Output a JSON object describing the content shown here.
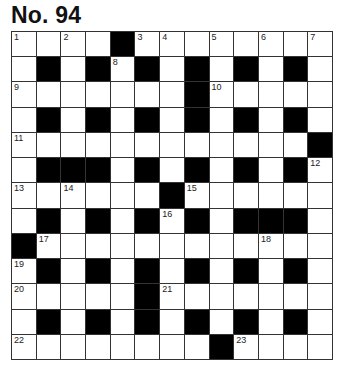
{
  "title": "No. 94",
  "grid": {
    "rows": 13,
    "cols": 13,
    "layout": [
      "WWWWBWWWWWWWW",
      "WBWBWBWBWBWBW",
      "WWWWWWWBWWWWW",
      "WBWBWBWBWBWBW",
      "WWWWWWWWWWWWB",
      "WBBBWBWBWBWBW",
      "WWWWWWBWWWWWW",
      "WBWBWBWBWBBBW",
      "BWWWWWWWWWWWW",
      "WBWBWBWBWBWBW",
      "WWWWWBWWWWWWW",
      "WBWBWBWBWBWBW",
      "WWWWWWWWBWWWW"
    ],
    "numbers": [
      {
        "r": 0,
        "c": 0,
        "n": "1"
      },
      {
        "r": 0,
        "c": 2,
        "n": "2"
      },
      {
        "r": 0,
        "c": 5,
        "n": "3"
      },
      {
        "r": 0,
        "c": 6,
        "n": "4"
      },
      {
        "r": 0,
        "c": 8,
        "n": "5"
      },
      {
        "r": 0,
        "c": 10,
        "n": "6"
      },
      {
        "r": 0,
        "c": 12,
        "n": "7"
      },
      {
        "r": 1,
        "c": 4,
        "n": "8"
      },
      {
        "r": 2,
        "c": 0,
        "n": "9"
      },
      {
        "r": 2,
        "c": 8,
        "n": "10"
      },
      {
        "r": 4,
        "c": 0,
        "n": "11"
      },
      {
        "r": 5,
        "c": 12,
        "n": "12"
      },
      {
        "r": 6,
        "c": 0,
        "n": "13"
      },
      {
        "r": 6,
        "c": 2,
        "n": "14"
      },
      {
        "r": 6,
        "c": 7,
        "n": "15"
      },
      {
        "r": 7,
        "c": 6,
        "n": "16"
      },
      {
        "r": 8,
        "c": 1,
        "n": "17"
      },
      {
        "r": 8,
        "c": 10,
        "n": "18"
      },
      {
        "r": 9,
        "c": 0,
        "n": "19"
      },
      {
        "r": 10,
        "c": 0,
        "n": "20"
      },
      {
        "r": 10,
        "c": 6,
        "n": "21"
      },
      {
        "r": 12,
        "c": 0,
        "n": "22"
      },
      {
        "r": 12,
        "c": 9,
        "n": "23"
      }
    ]
  }
}
